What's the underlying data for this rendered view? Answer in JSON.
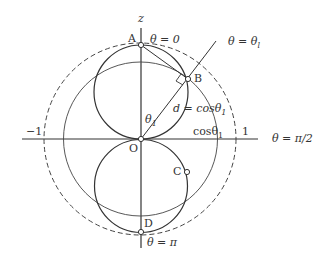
{
  "diagram": {
    "axes": {
      "z_label": "z",
      "x_right_label": "θ = π/2",
      "tick_neg": "−1",
      "tick_pos": "1"
    },
    "points": {
      "A": "A",
      "B": "B",
      "C": "C",
      "D": "D",
      "O": "O"
    },
    "annotations": {
      "theta_zero": "θ = 0",
      "theta_l": "θ = θ",
      "theta_l_sub": "l",
      "theta_pi": "θ = π",
      "theta1": "θ",
      "theta1_sub": "1",
      "distance": "d = cosθ",
      "distance_sub": "1",
      "cos_label": "cosθ",
      "cos_sub": "1"
    },
    "colors": {
      "stroke": "#333333",
      "background": "#ffffff"
    }
  }
}
